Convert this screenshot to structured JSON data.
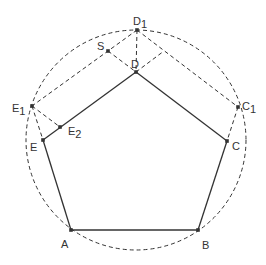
{
  "diagram": {
    "colors": {
      "stroke": "#333333",
      "background": "#ffffff"
    },
    "circle": {
      "cx": 136,
      "cy": 140,
      "r": 110
    },
    "points": {
      "A": {
        "x": 71,
        "y": 230,
        "label": "A",
        "sub": "",
        "lx": 61,
        "ly": 248
      },
      "B": {
        "x": 198,
        "y": 230,
        "label": "B",
        "sub": "",
        "lx": 202,
        "ly": 249
      },
      "C": {
        "x": 227,
        "y": 141,
        "label": "C",
        "sub": "",
        "lx": 232,
        "ly": 150
      },
      "D": {
        "x": 136,
        "y": 72,
        "label": "D",
        "sub": "",
        "lx": 131,
        "ly": 68
      },
      "E": {
        "x": 43,
        "y": 140,
        "label": "E",
        "sub": "",
        "lx": 30,
        "ly": 151
      },
      "D1": {
        "x": 137,
        "y": 30,
        "label": "D",
        "sub": "1",
        "lx": 133,
        "ly": 25
      },
      "C1": {
        "x": 238,
        "y": 107,
        "label": "C",
        "sub": "1",
        "lx": 242,
        "ly": 110
      },
      "E1": {
        "x": 32,
        "y": 106,
        "label": "E",
        "sub": "1",
        "lx": 12,
        "ly": 112
      },
      "E2": {
        "x": 60,
        "y": 127,
        "label": "E",
        "sub": "2",
        "lx": 68,
        "ly": 135
      },
      "S": {
        "x": 108,
        "y": 51,
        "label": "S",
        "sub": "",
        "lx": 97,
        "ly": 50
      }
    },
    "pentagon_edges": [
      [
        "A",
        "B"
      ],
      [
        "B",
        "C"
      ],
      [
        "C",
        "D"
      ],
      [
        "D",
        "E"
      ],
      [
        "E",
        "A"
      ]
    ],
    "dashed_lines": [
      [
        "D1",
        "E1"
      ],
      [
        "D1",
        "C1"
      ],
      [
        "D1",
        "D"
      ],
      [
        "S",
        "D"
      ],
      [
        "E1",
        "E2"
      ],
      [
        "E1",
        "E"
      ],
      [
        "C1",
        "C"
      ],
      [
        "D",
        "T"
      ]
    ],
    "extra_points": {
      "T": {
        "x": 164,
        "y": 51
      }
    }
  }
}
